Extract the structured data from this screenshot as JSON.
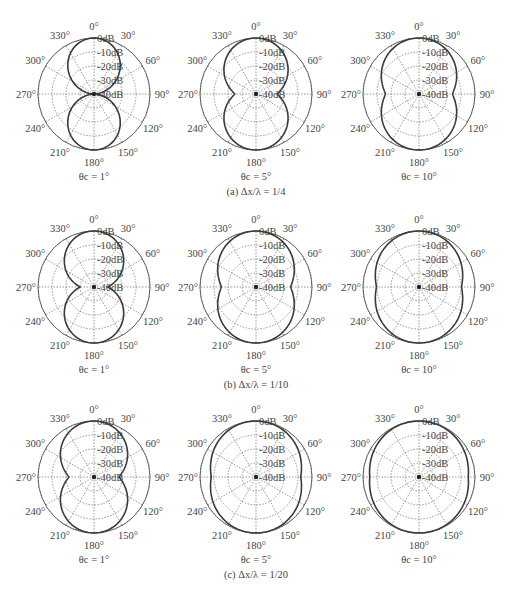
{
  "chart_data": [
    {
      "type": "polar-line",
      "panel": "a",
      "row_caption": "(a) Δx/λ = 1/4",
      "values_are_estimates": true,
      "plots": [
        {
          "subtitle": "θc = 1°",
          "theta_c": 1,
          "min_at_90": 0.0
        },
        {
          "subtitle": "θc = 5°",
          "theta_c": 5,
          "min_at_90": 0.38
        },
        {
          "subtitle": "θc = 10°",
          "theta_c": 10,
          "min_at_90": 0.6
        }
      ]
    },
    {
      "type": "polar-line",
      "panel": "b",
      "row_caption": "(b) Δx/λ = 1/10",
      "values_are_estimates": true,
      "plots": [
        {
          "subtitle": "θc = 1°",
          "theta_c": 1,
          "min_at_90": 0.25
        },
        {
          "subtitle": "θc = 5°",
          "theta_c": 5,
          "min_at_90": 0.62
        },
        {
          "subtitle": "θc = 10°",
          "theta_c": 10,
          "min_at_90": 0.76
        }
      ]
    },
    {
      "type": "polar-line",
      "panel": "c",
      "row_caption": "(c) Δx/λ = 1/20",
      "values_are_estimates": true,
      "plots": [
        {
          "subtitle": "θc = 1°",
          "theta_c": 1,
          "min_at_90": 0.45
        },
        {
          "subtitle": "θc = 5°",
          "theta_c": 5,
          "min_at_90": 0.8
        },
        {
          "subtitle": "θc = 10°",
          "theta_c": 10,
          "min_at_90": 0.88
        }
      ]
    }
  ],
  "axes": {
    "angle_ticks": [
      "0°",
      "30°",
      "60°",
      "90°",
      "120°",
      "150°",
      "180°",
      "210°",
      "240°",
      "270°",
      "300°",
      "330°"
    ],
    "radial_ticks": [
      "0dB",
      "-10dB",
      "-20dB",
      "-30dB",
      "-40dB"
    ],
    "radial_range_db": [
      -40,
      0
    ],
    "grid": true
  }
}
